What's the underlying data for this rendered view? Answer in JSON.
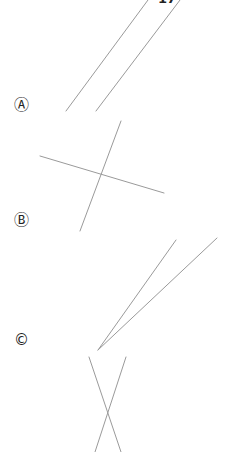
{
  "header": {
    "clipped_text": "17"
  },
  "labels": [
    {
      "id": "A",
      "text": "Ⓐ",
      "x": 14,
      "y": 98
    },
    {
      "id": "B",
      "text": "Ⓑ",
      "x": 14,
      "y": 213
    },
    {
      "id": "C",
      "text": "©",
      "x": 14,
      "y": 333
    }
  ],
  "figures": {
    "A": {
      "description": "two parallel lines",
      "line_color": "#9a9a9a"
    },
    "B": {
      "description": "two intersecting lines (perpendicular-like)",
      "line_color": "#9a9a9a"
    },
    "C": {
      "description": "two lines meeting at a vertex forming an acute angle",
      "line_color": "#9a9a9a"
    },
    "D": {
      "description": "two intersecting lines forming an X",
      "line_color": "#9a9a9a"
    }
  }
}
